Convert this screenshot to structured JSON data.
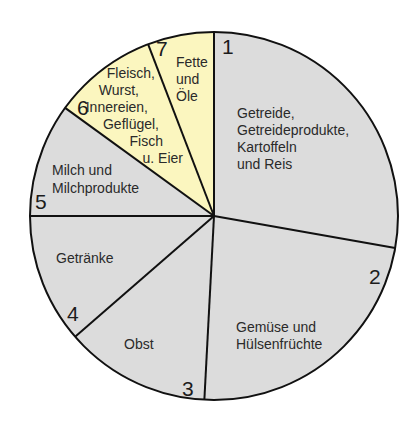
{
  "chart_data": {
    "type": "pie",
    "title": "",
    "start_angle_deg": 0,
    "direction": "clockwise",
    "center": [
      214,
      216
    ],
    "radius": 184,
    "categories": [
      "Getreide, Getreideprodukte, Kartoffeln und Reis",
      "Gemüse und Hülsenfrüchte",
      "Obst",
      "Getränke",
      "Milch und Milchprodukte",
      "Fleisch, Wurst, Innereien, Geflügel, Fisch u. Eier",
      "Fette und Öle"
    ],
    "values": [
      100,
      83,
      46,
      41,
      36,
      33,
      21
    ],
    "value_unit": "degrees of arc (measured)",
    "segments": [
      {
        "number": "1",
        "lines": [
          "Getreide,",
          "Getreideprodukte,",
          "Kartoffeln",
          "und Reis"
        ],
        "angle": 100,
        "color": "#dcdcdc"
      },
      {
        "number": "2",
        "lines": [
          "Gemüse und",
          "Hülsenfrüchte"
        ],
        "angle": 83,
        "color": "#dcdcdc"
      },
      {
        "number": "3",
        "lines": [
          "Obst"
        ],
        "angle": 46,
        "color": "#dcdcdc"
      },
      {
        "number": "4",
        "lines": [
          "Getränke"
        ],
        "angle": 41,
        "color": "#dcdcdc"
      },
      {
        "number": "5",
        "lines": [
          "Milch und",
          "Milchprodukte"
        ],
        "angle": 36,
        "color": "#dcdcdc"
      },
      {
        "number": "6",
        "lines": [
          "Fleisch,",
          "Wurst,",
          "Innereien,",
          "Geflügel,",
          "Fisch",
          "u. Eier"
        ],
        "angle": 33,
        "color": "#fbf6bf"
      },
      {
        "number": "7",
        "lines": [
          "Fette",
          "und",
          "Öle"
        ],
        "angle": 21,
        "color": "#fbf6bf"
      }
    ],
    "legend": "none",
    "grid": false
  }
}
